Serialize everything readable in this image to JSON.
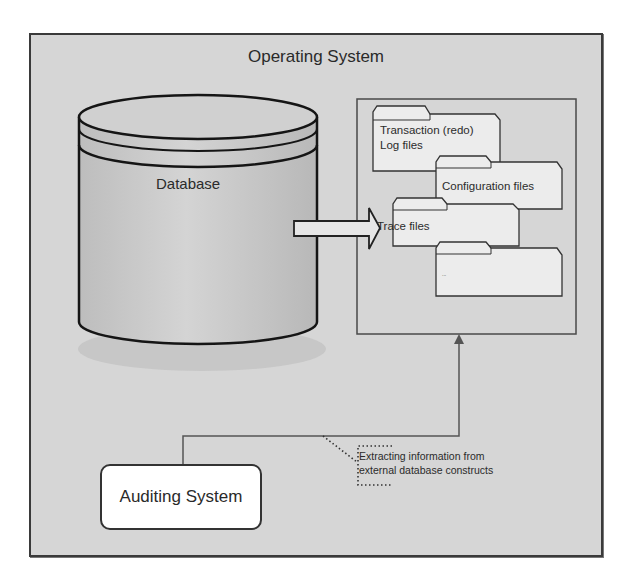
{
  "diagram": {
    "outer_container": {
      "title": "Operating System"
    },
    "database": {
      "label": "Database"
    },
    "arrow": {
      "direction": "right",
      "from": "Database",
      "to": "files-container"
    },
    "files_container": {
      "folders": [
        {
          "label": "Transaction (redo) Log files"
        },
        {
          "label": "Configuration files"
        },
        {
          "label": "Trace files"
        },
        {
          "label": "..."
        }
      ]
    },
    "auditing_system": {
      "label": "Auditing System"
    },
    "connector": {
      "from": "Auditing System",
      "to": "files-container"
    },
    "callout": {
      "line1": "Extracting information from",
      "line2": "external database constructs"
    },
    "colors": {
      "background": "#d6d6d6",
      "border": "#333333",
      "folder_fill": "#ececec",
      "auditing_fill": "#ffffff"
    }
  }
}
